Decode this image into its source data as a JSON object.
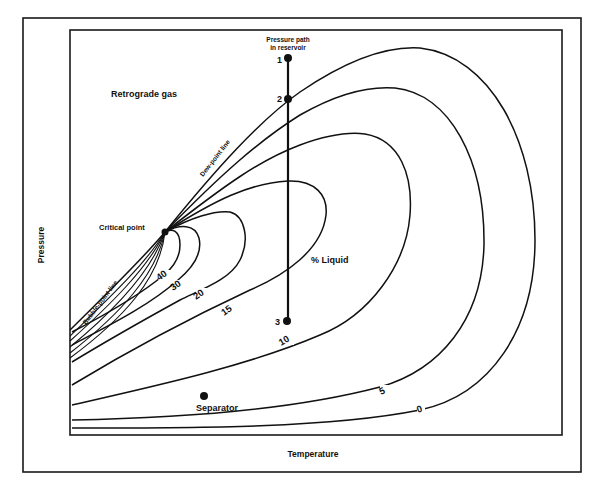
{
  "diagram": {
    "title": "",
    "axes": {
      "x_label": "Temperature",
      "y_label": "Pressure"
    },
    "region_labels": {
      "retrograde_gas": "Retrograde gas",
      "percent_liquid": "% Liquid",
      "dew_point_line": "Dew-point line",
      "bubble_point_line": "Bubble-point line",
      "critical_point": "Critical point",
      "separator": "Separator",
      "pressure_path_line1": "Pressure path",
      "pressure_path_line2": "in reservoir"
    },
    "pressure_path_points": [
      {
        "label": "1"
      },
      {
        "label": "2"
      },
      {
        "label": "3"
      }
    ],
    "quality_lines": [
      {
        "label": "40"
      },
      {
        "label": "30"
      },
      {
        "label": "20"
      },
      {
        "label": "15"
      },
      {
        "label": "10"
      },
      {
        "label": "5"
      },
      {
        "label": "0"
      }
    ],
    "colors": {
      "ink": "#111111",
      "background": "#ffffff"
    }
  }
}
